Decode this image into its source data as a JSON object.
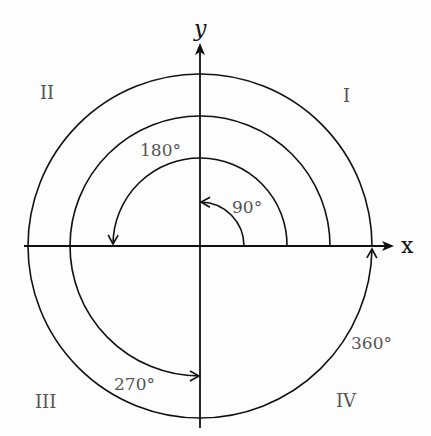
{
  "diagram": {
    "axes": {
      "x_label": "x",
      "y_label": "y"
    },
    "quadrants": [
      {
        "id": "I",
        "label": "I"
      },
      {
        "id": "II",
        "label": "II"
      },
      {
        "id": "III",
        "label": "III"
      },
      {
        "id": "IV",
        "label": "IV"
      }
    ],
    "angles": [
      {
        "value": 90,
        "label": "90°"
      },
      {
        "value": 180,
        "label": "180°"
      },
      {
        "value": 270,
        "label": "270°"
      },
      {
        "value": 360,
        "label": "360°"
      }
    ],
    "colors": {
      "stroke": "#111111",
      "label": "#555555",
      "background": "#fdfdfd"
    }
  }
}
